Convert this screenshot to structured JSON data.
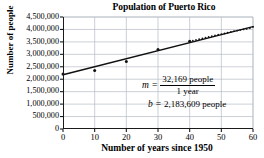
{
  "chart_data": {
    "type": "scatter",
    "title": "Population of Puerto Rico",
    "xlabel": "Number of years since 1950",
    "ylabel": "Number of people",
    "xlim": [
      0,
      60
    ],
    "ylim": [
      0,
      4500000
    ],
    "grid": true,
    "legend": "none",
    "xticks": [
      "0",
      "10",
      "20",
      "30",
      "40",
      "50",
      "60"
    ],
    "xtick_values": [
      0,
      10,
      20,
      30,
      40,
      50,
      60
    ],
    "yticks": [
      "0",
      "500,000",
      "1,000,000",
      "1,500,000",
      "2,000,000",
      "2,500,000",
      "3,000,000",
      "3,500,000",
      "4,000,000",
      "4,500,000"
    ],
    "ytick_values": [
      0,
      500000,
      1000000,
      1500000,
      2000000,
      2500000,
      3000000,
      3500000,
      4000000,
      4500000
    ],
    "series": [
      {
        "name": "Population data points",
        "x": [
          0,
          10,
          20,
          30,
          40,
          41,
          42,
          43,
          44,
          45,
          46,
          47,
          48,
          49,
          50,
          51,
          52,
          53,
          54,
          55,
          56,
          57,
          58,
          59,
          60
        ],
        "values": [
          2210703,
          2349544,
          2712033,
          3196520,
          3522037,
          3550000,
          3580000,
          3610000,
          3640000,
          3670000,
          3700000,
          3730000,
          3760000,
          3790000,
          3810000,
          3840000,
          3870000,
          3900000,
          3930000,
          3955000,
          3980000,
          4000000,
          4020000,
          4050000,
          4100000
        ]
      },
      {
        "name": "Line of best fit",
        "x": [
          0,
          60
        ],
        "values": [
          2183609,
          4113749
        ]
      }
    ],
    "annotations": {
      "slope_var": "m",
      "equals": "=",
      "slope_numerator": "32,169 people",
      "slope_denominator": "1 year",
      "intercept_var": "b",
      "intercept_value": "2,183,609 people"
    }
  },
  "colors": {
    "axis": "#1a1a1a",
    "grid": "#b6bcc6",
    "line": "#101010",
    "marker": "#101010",
    "background": "#ffffff"
  }
}
